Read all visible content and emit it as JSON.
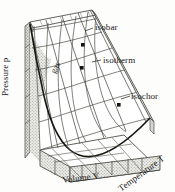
{
  "figure": {
    "type": "3d-surface-diagram",
    "axes": {
      "vertical": "Pressure p",
      "horizontal": "Volume V",
      "depth": "Temperature T"
    },
    "region_label": "gas",
    "curve_labels": {
      "isobar": "isobar",
      "isotherm": "isotherm",
      "isochor": "isochor"
    },
    "markers": [
      {
        "name": "isobar-marker",
        "x": 83,
        "y": 45
      },
      {
        "name": "isotherm-marker",
        "x": 82,
        "y": 68
      },
      {
        "name": "isochor-marker",
        "x": 119,
        "y": 105
      }
    ],
    "colors": {
      "ink": "#1a1a18",
      "grid": "#555550",
      "stipple": "#b8b8b2",
      "stipple_fill": "#e8e8e4",
      "surface": "#ffffff",
      "paper": "#fdfdfc"
    }
  }
}
